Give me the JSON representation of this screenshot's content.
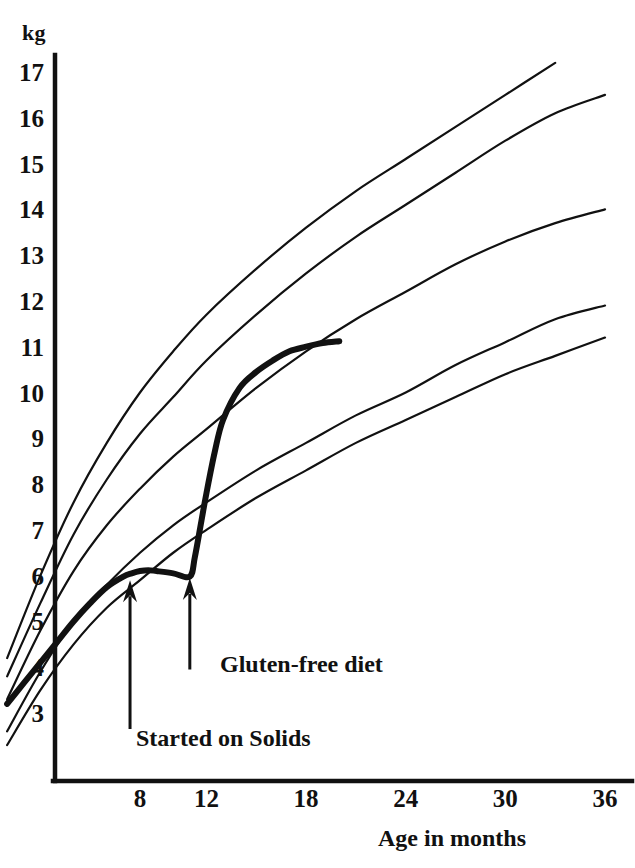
{
  "chart_data": {
    "type": "line",
    "title": "",
    "xlabel": "Age in months",
    "ylabel": "kg",
    "y_unit_label": "kg",
    "grid": false,
    "legend_position": "none",
    "xlim": [
      0,
      36
    ],
    "ylim": [
      2,
      17.6
    ],
    "x_ticks": [
      "8",
      "12",
      "18",
      "24",
      "30",
      "36"
    ],
    "x_tick_values": [
      8,
      12,
      18,
      24,
      30,
      36
    ],
    "y_ticks": [
      "3",
      "4",
      "5",
      "6",
      "7",
      "8",
      "9",
      "10",
      "11",
      "12",
      "13",
      "14",
      "15",
      "16",
      "17"
    ],
    "y_tick_values": [
      3,
      4,
      5,
      6,
      7,
      8,
      9,
      10,
      11,
      12,
      13,
      14,
      15,
      16,
      17
    ],
    "series": [
      {
        "name": "97th centile",
        "style": "thin",
        "x": [
          0,
          2,
          4,
          6,
          8,
          10,
          12,
          15,
          18,
          21,
          24,
          27,
          30,
          33
        ],
        "values": [
          4.2,
          6.0,
          7.6,
          8.9,
          10.0,
          10.9,
          11.7,
          12.7,
          13.6,
          14.4,
          15.1,
          15.8,
          16.5,
          17.2
        ]
      },
      {
        "name": "90th centile",
        "style": "thin",
        "x": [
          0,
          2,
          4,
          6,
          8,
          10,
          12,
          15,
          18,
          21,
          24,
          27,
          30,
          33,
          36
        ],
        "values": [
          3.8,
          5.4,
          6.9,
          8.1,
          9.1,
          9.9,
          10.7,
          11.7,
          12.6,
          13.4,
          14.1,
          14.8,
          15.5,
          16.1,
          16.5
        ]
      },
      {
        "name": "50th centile",
        "style": "thin",
        "x": [
          0,
          2,
          4,
          6,
          8,
          10,
          12,
          15,
          18,
          21,
          24,
          27,
          30,
          33,
          36
        ],
        "values": [
          3.3,
          4.8,
          6.1,
          7.1,
          7.9,
          8.6,
          9.2,
          10.1,
          10.9,
          11.6,
          12.2,
          12.8,
          13.3,
          13.7,
          14.0
        ]
      },
      {
        "name": "10th centile",
        "style": "thin",
        "x": [
          0,
          2,
          4,
          6,
          8,
          10,
          12,
          15,
          18,
          21,
          24,
          27,
          30,
          33,
          36
        ],
        "values": [
          2.6,
          3.9,
          5.0,
          5.8,
          6.5,
          7.1,
          7.6,
          8.3,
          8.9,
          9.5,
          10.0,
          10.6,
          11.1,
          11.6,
          11.9
        ]
      },
      {
        "name": "3rd centile",
        "style": "thin",
        "x": [
          0,
          2,
          4,
          6,
          8,
          10,
          12,
          15,
          18,
          21,
          24,
          27,
          30,
          33,
          36
        ],
        "values": [
          2.3,
          3.5,
          4.5,
          5.3,
          5.9,
          6.5,
          7.0,
          7.7,
          8.3,
          8.9,
          9.4,
          9.9,
          10.4,
          10.8,
          11.2
        ]
      },
      {
        "name": "Patient",
        "style": "thick",
        "x": [
          0,
          1,
          2,
          3,
          4,
          5,
          6,
          7,
          7.5,
          8,
          8.5,
          9,
          10,
          11,
          11.3,
          11.7,
          12,
          12.5,
          13,
          14,
          15,
          16,
          17,
          18,
          19,
          20
        ],
        "values": [
          3.2,
          3.65,
          4.1,
          4.55,
          5.0,
          5.4,
          5.75,
          5.98,
          6.05,
          6.1,
          6.12,
          6.1,
          6.05,
          5.98,
          6.4,
          7.2,
          7.8,
          8.7,
          9.4,
          10.1,
          10.45,
          10.7,
          10.9,
          11.0,
          11.08,
          11.12
        ]
      }
    ],
    "annotations": [
      {
        "label": "Started on Solids",
        "arrow_x_month": 7.4,
        "arrow_tip_kg": 5.9,
        "arrow_tail_kg": 2.65,
        "label_x_month": 7.9,
        "label_kg": 2.7
      },
      {
        "label": "Gluten-free diet",
        "arrow_x_month": 11.0,
        "arrow_tip_kg": 5.95,
        "arrow_tail_kg": 3.95,
        "label_x_month": 11.5,
        "label_kg": 4.0
      }
    ]
  },
  "axis": {
    "y_unit": "kg",
    "x_title": "Age in months"
  },
  "annotations": {
    "started_on_solids": "Started on Solids",
    "gluten_free_diet": "Gluten-free diet"
  },
  "colors": {
    "ink": "#111111",
    "background": "#ffffff"
  }
}
